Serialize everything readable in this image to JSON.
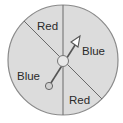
{
  "spinner": {
    "colors": {
      "fill": "#dcdcdc",
      "stroke": "#8a8a8a",
      "line": "#6a6a6a",
      "hub": "#c8c8c8",
      "text": "#2a2a2a"
    },
    "sections": [
      {
        "label": "Red",
        "position": "top-left"
      },
      {
        "label": "Blue",
        "position": "right"
      },
      {
        "label": "Blue",
        "position": "left"
      },
      {
        "label": "Red",
        "position": "bottom-right"
      }
    ],
    "pointer": {
      "direction": "up-right",
      "icon": "arrow-pointer"
    }
  }
}
